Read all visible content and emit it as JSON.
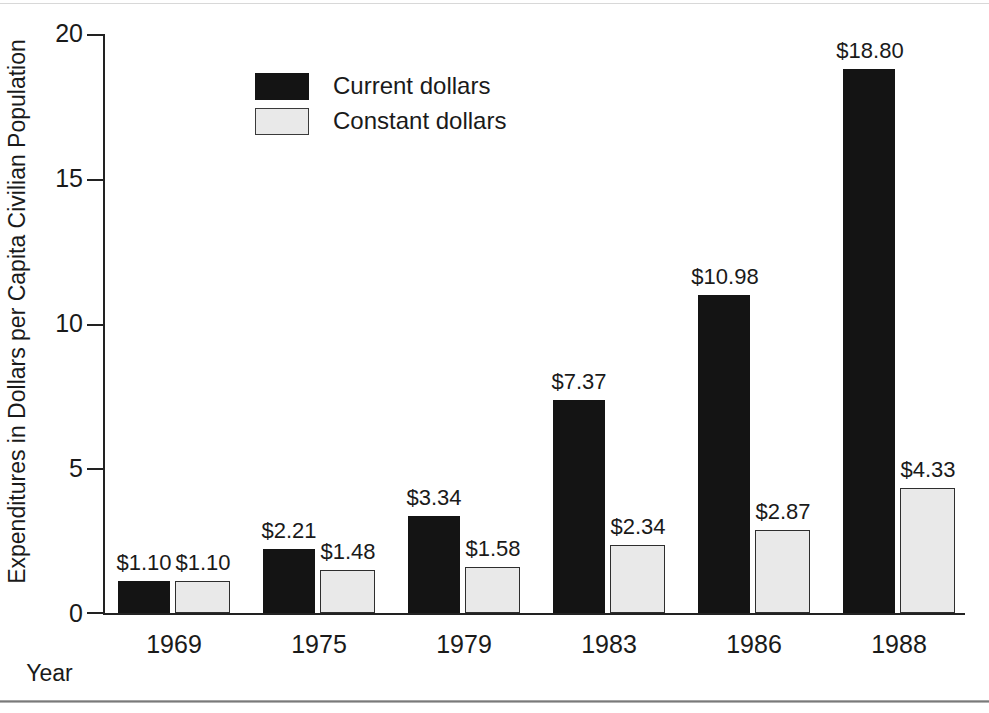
{
  "chart_data": {
    "type": "bar",
    "title": "",
    "xlabel": "Year",
    "ylabel": "Expenditures in Dollars per Capita Civilian Population",
    "categories": [
      "1969",
      "1975",
      "1979",
      "1983",
      "1986",
      "1988"
    ],
    "series": [
      {
        "name": "Current dollars",
        "color": "#141414",
        "values": [
          1.1,
          2.21,
          3.34,
          7.37,
          10.98,
          18.8
        ],
        "labels": [
          "$1.10",
          "$2.21",
          "$3.34",
          "$7.37",
          "$10.98",
          "$18.80"
        ]
      },
      {
        "name": "Constant dollars",
        "color": "#e9e9e9",
        "values": [
          1.1,
          1.48,
          1.58,
          2.34,
          2.87,
          4.33
        ],
        "labels": [
          "$1.10",
          "$1.48",
          "$1.58",
          "$2.34",
          "$2.87",
          "$4.33"
        ]
      }
    ],
    "ylim": [
      0,
      20
    ],
    "yticks": [
      0,
      5,
      10,
      15,
      20
    ],
    "ytick_labels": [
      "0",
      "5",
      "10",
      "15",
      "20"
    ],
    "grid": false,
    "legend_position": "upper-left-inside"
  },
  "axes": {
    "y_title": "Expenditures in Dollars per Capita Civilian Population",
    "x_title": "Year",
    "y_ticks": [
      {
        "value": 20,
        "label": "20"
      },
      {
        "value": 15,
        "label": "15"
      },
      {
        "value": 10,
        "label": "10"
      },
      {
        "value": 5,
        "label": "5"
      },
      {
        "value": 0,
        "label": "0"
      }
    ]
  },
  "legend": {
    "items": [
      {
        "label": "Current dollars",
        "swatch": "dark"
      },
      {
        "label": "Constant dollars",
        "swatch": "light"
      }
    ]
  },
  "colors": {
    "current_dollars": "#141414",
    "constant_dollars": "#e9e9e9",
    "axis": "#222222",
    "text": "#1a1a1a",
    "background": "#ffffff"
  }
}
